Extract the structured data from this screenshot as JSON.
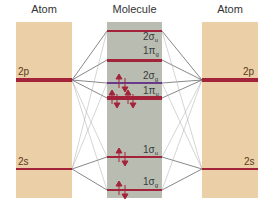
{
  "headers": {
    "left": "Atom",
    "middle": "Molecule",
    "right": "Atom"
  },
  "atomic_levels": {
    "p": "2p",
    "s": "2s"
  },
  "molecular_orbitals": [
    {
      "id": "2sigma_u",
      "label": "2σ",
      "sub": "u",
      "y": 31,
      "electrons": 0
    },
    {
      "id": "1pi_g",
      "label": "1π",
      "sub": "g",
      "y": 60,
      "electrons": 0
    },
    {
      "id": "2sigma_g",
      "label": "2σ",
      "sub": "g",
      "y": 83,
      "electrons": 2
    },
    {
      "id": "1pi_u",
      "label": "1π",
      "sub": "u",
      "y": 98,
      "electrons": 4
    },
    {
      "id": "1sigma_u",
      "label": "1σ",
      "sub": "u",
      "y": 157,
      "electrons": 2
    },
    {
      "id": "1sigma_g",
      "label": "1σ",
      "sub": "g",
      "y": 190,
      "electrons": 2
    }
  ],
  "colors": {
    "atom_bg": "#ebcfa6",
    "molecule_bg": "#b9bdb1",
    "level": "#a3243a",
    "sigma_g2": "#6a3a8a",
    "lines": "#555555",
    "arrow": "#a3243a"
  }
}
